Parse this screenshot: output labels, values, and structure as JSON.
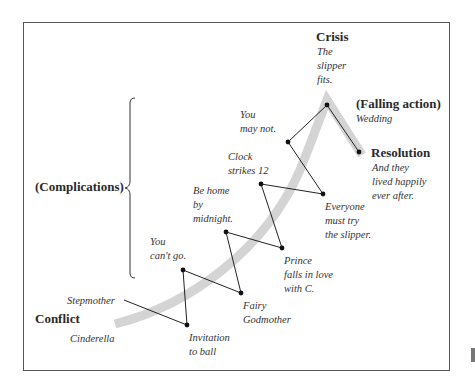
{
  "diagram": {
    "title_labels": {
      "crisis": "Crisis",
      "falling_action": "(Falling action)",
      "resolution": "Resolution",
      "complications": "(Complications)",
      "conflict": "Conflict"
    },
    "annotations": {
      "crisis_text": "The\nslipper\nfits.",
      "falling_action_text": "Wedding",
      "resolution_text": "And they\nlived happily\never after.",
      "conflict_text": "Cinderella",
      "stepmother": "Stepmother",
      "invitation": "Invitation\nto ball",
      "you_cant_go": "You\ncan't go.",
      "fairy_godmother": "Fairy\nGodmother",
      "be_home": "Be home\nby\nmidnight.",
      "prince": "Prince\nfalls in love\nwith C.",
      "clock": "Clock\nstrikes 12",
      "everyone": "Everyone\nmust try\nthe slipper.",
      "you_may_not": "You\nmay not."
    },
    "colors": {
      "arc": "#d4d4d4",
      "line": "#222222",
      "frame": "#555555"
    },
    "plot_points": [
      {
        "name": "stepmother-start",
        "x": 124,
        "y": 300,
        "dot": false
      },
      {
        "name": "invitation",
        "x": 187,
        "y": 325,
        "dot": true
      },
      {
        "name": "you-cant-go",
        "x": 183,
        "y": 270,
        "dot": true
      },
      {
        "name": "fairy-godmother",
        "x": 241,
        "y": 293,
        "dot": true
      },
      {
        "name": "be-home",
        "x": 226,
        "y": 232,
        "dot": true
      },
      {
        "name": "prince",
        "x": 282,
        "y": 248,
        "dot": true
      },
      {
        "name": "clock",
        "x": 261,
        "y": 184,
        "dot": true
      },
      {
        "name": "everyone",
        "x": 323,
        "y": 194,
        "dot": true
      },
      {
        "name": "you-may-not",
        "x": 288,
        "y": 142,
        "dot": true
      },
      {
        "name": "crisis",
        "x": 327,
        "y": 105,
        "dot": true
      },
      {
        "name": "resolution",
        "x": 359,
        "y": 152,
        "dot": true
      }
    ]
  }
}
